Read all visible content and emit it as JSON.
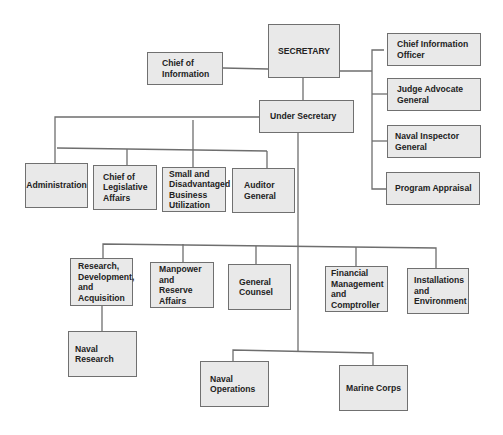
{
  "chart": {
    "nodes": {
      "secretary": "SECRETARY",
      "chief_of_information": "Chief of Information",
      "chief_information_officer": "Chief Information\nOfficer",
      "judge_advocate_general": "Judge Advocate\nGeneral",
      "naval_inspector_general": "Naval Inspector General",
      "program_appraisal": "Program Appraisal",
      "under_secretary": "Under Secretary",
      "administration": "Administration",
      "chief_of_legislative_affairs": "Chief of\nLegislative\nAffairs",
      "small_business": "Small and\nDisadvantaged\nBusiness\nUtilization",
      "auditor_general": "Auditor\nGeneral",
      "research_development_acquisition": "Research,\nDevelopment,\nand\nAcquisition",
      "manpower_reserve_affairs": "Manpower\nand Reserve\nAffairs",
      "general_counsel": "General\nCounsel",
      "financial_management": "Financial\nManagement\nand\nComptroller",
      "installations_environment": "Installations\nand\nEnvironment",
      "naval_research": "Naval\nResearch",
      "naval_operations": "Naval\nOperations",
      "marine_corps": "Marine Corps"
    },
    "edges": [
      [
        "secretary",
        "chief_of_information"
      ],
      [
        "secretary",
        "chief_information_officer"
      ],
      [
        "secretary",
        "judge_advocate_general"
      ],
      [
        "secretary",
        "naval_inspector_general"
      ],
      [
        "secretary",
        "program_appraisal"
      ],
      [
        "secretary",
        "under_secretary"
      ],
      [
        "under_secretary",
        "administration"
      ],
      [
        "under_secretary",
        "chief_of_legislative_affairs"
      ],
      [
        "under_secretary",
        "small_business"
      ],
      [
        "under_secretary",
        "auditor_general"
      ],
      [
        "under_secretary",
        "research_development_acquisition"
      ],
      [
        "under_secretary",
        "manpower_reserve_affairs"
      ],
      [
        "under_secretary",
        "general_counsel"
      ],
      [
        "under_secretary",
        "financial_management"
      ],
      [
        "under_secretary",
        "installations_environment"
      ],
      [
        "research_development_acquisition",
        "naval_research"
      ],
      [
        "under_secretary",
        "naval_operations"
      ],
      [
        "under_secretary",
        "marine_corps"
      ]
    ],
    "colors": {
      "box_fill": "#e9e9e9",
      "box_border": "#707070",
      "line": "#6e6e6e",
      "text": "#222222"
    }
  }
}
